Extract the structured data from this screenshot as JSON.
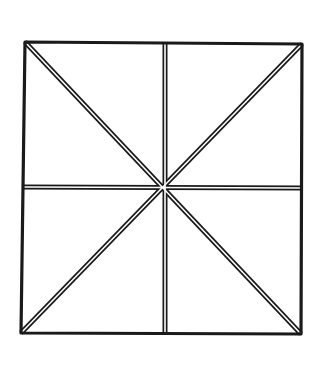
{
  "diagram": {
    "stroke_color": "#1a1a1a",
    "background": "#ffffff",
    "square": {
      "top_left": [
        25,
        42
      ],
      "top_right": [
        302,
        44
      ],
      "bottom_right": [
        301,
        334
      ],
      "bottom_left": [
        21,
        333
      ]
    },
    "center": [
      165,
      187
    ],
    "lines": [
      {
        "name": "vertical-midline",
        "from": [
          165,
          43
        ],
        "to": [
          165,
          334
        ]
      },
      {
        "name": "horizontal-midline",
        "from": [
          23,
          187
        ],
        "to": [
          302,
          188
        ]
      },
      {
        "name": "diagonal-tl-br",
        "from": [
          25,
          42
        ],
        "to": [
          301,
          334
        ]
      },
      {
        "name": "diagonal-tr-bl",
        "from": [
          302,
          44
        ],
        "to": [
          21,
          333
        ]
      }
    ]
  }
}
